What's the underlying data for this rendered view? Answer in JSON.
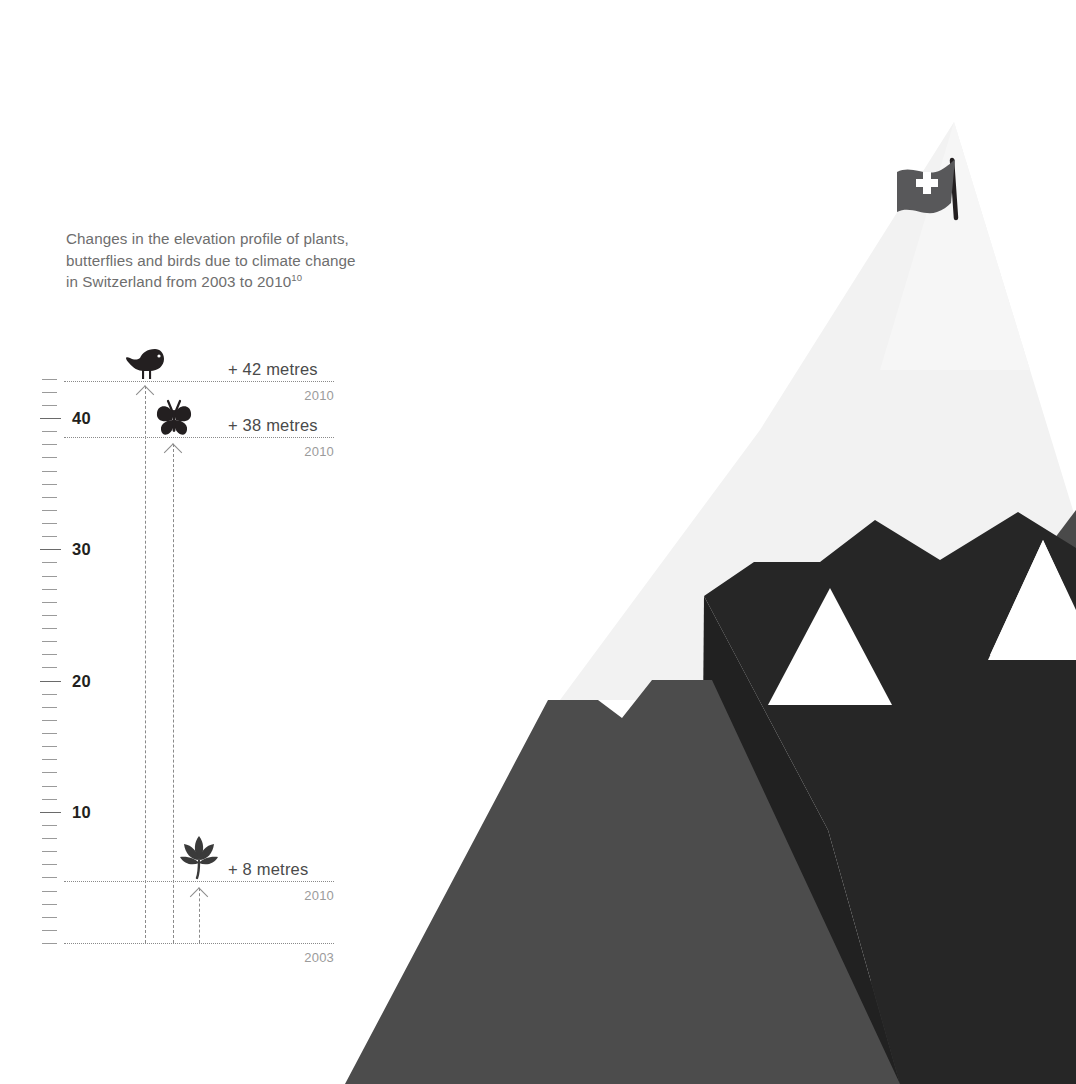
{
  "title": {
    "lines": [
      "Changes in the elevation profile of plants,",
      "butterflies and birds due to climate change",
      "in Switzerland from 2003 to 2010"
    ],
    "footnote_marker": "10"
  },
  "colors": {
    "text_title": "#6e6e6e",
    "text_value": "#4a4a4a",
    "text_year": "#9b9b9b",
    "axis_label": "#231f20",
    "grid": "#8a8a8a",
    "mountain_front": "#4c4c4c",
    "mountain_dark": "#262626",
    "mountain_mid": "#3a3a3a",
    "mountain_back": "#f1f1f1",
    "snow": "#ffffff",
    "flag": "#58585a"
  },
  "axis": {
    "unit": "metres",
    "major_ticks": [
      {
        "value": 10,
        "label": "10"
      },
      {
        "value": 20,
        "label": "20"
      },
      {
        "value": 30,
        "label": "30"
      },
      {
        "value": 40,
        "label": "40"
      }
    ],
    "min": 0,
    "max": 45,
    "minor_step": 1
  },
  "baseline": {
    "label": "2003",
    "value": 0
  },
  "chart_data": {
    "type": "bar",
    "title": "Changes in the elevation profile of plants, butterflies and birds due to climate change in Switzerland from 2003 to 2010",
    "xlabel": "",
    "ylabel": "metres",
    "ylim": [
      0,
      45
    ],
    "grid": true,
    "legend": "none",
    "baseline_year": "2003",
    "comparison_year": "2010",
    "categories": [
      "plants",
      "butterflies",
      "birds"
    ],
    "values": [
      8,
      38,
      42
    ],
    "series": [
      {
        "name": "Elevation shift 2003–2010 (metres)",
        "values": [
          8,
          38,
          42
        ]
      }
    ]
  },
  "markers": [
    {
      "id": "birds",
      "icon": "bird-icon",
      "value_label": "+ 42 metres",
      "year_label": "2010",
      "value": 42
    },
    {
      "id": "butterflies",
      "icon": "butterfly-icon",
      "value_label": "+ 38 metres",
      "year_label": "2010",
      "value": 38
    },
    {
      "id": "plants",
      "icon": "plant-icon",
      "value_label": "+ 8 metres",
      "year_label": "2010",
      "value": 8
    }
  ],
  "scenery": {
    "flag": "swiss-flag-icon"
  }
}
